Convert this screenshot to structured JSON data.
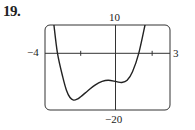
{
  "problem": {
    "number": "19."
  },
  "chart_data": {
    "type": "line",
    "title": "",
    "xlabel": "",
    "ylabel": "",
    "xlim": [
      -4,
      3
    ],
    "ylim": [
      -20,
      10
    ],
    "x_tick_labels": {
      "left": "−4",
      "right": "3"
    },
    "y_tick_labels": {
      "top": "10",
      "bottom": "−20"
    },
    "x_ticks": [
      -2,
      2
    ],
    "grid": false,
    "series": [
      {
        "name": "f(x)",
        "x": [
          -3.5,
          -3.3,
          -3.0,
          -2.8,
          -2.6,
          -2.4,
          -2.2,
          -2.0,
          -1.6,
          -1.2,
          -0.8,
          -0.45,
          0.0,
          0.3,
          0.6,
          0.9,
          1.25,
          1.6
        ],
        "values": [
          10,
          0,
          -8.5,
          -13,
          -15.6,
          -16.5,
          -16.2,
          -15.3,
          -13.2,
          -11.2,
          -9.9,
          -9.5,
          -10.0,
          -10.3,
          -9.5,
          -6.5,
          0,
          10
        ]
      }
    ]
  }
}
